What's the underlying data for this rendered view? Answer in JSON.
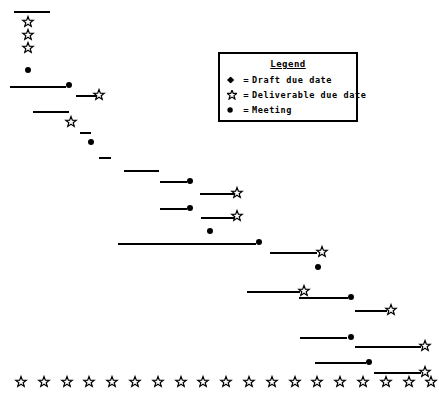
{
  "chart_data": {
    "type": "gantt",
    "title": "",
    "xlabel": "",
    "ylabel": "",
    "grid": false,
    "legend": {
      "title": "Legend",
      "position": "top-right",
      "entries": [
        {
          "symbol": "diamond",
          "equals": "=",
          "label": "Draft due date",
          "color": "#000000"
        },
        {
          "symbol": "star",
          "equals": "=",
          "label": "Deliverable due date",
          "color": "#000000"
        },
        {
          "symbol": "circle",
          "equals": "=",
          "label": "Meeting",
          "color": "#000000"
        }
      ]
    },
    "legend_box": {
      "x": 218,
      "y": 52,
      "width": 140,
      "height": 70
    },
    "bars": [
      {
        "id": "bar-1",
        "x1": 14,
        "x2": 50,
        "y": 11
      },
      {
        "id": "bar-2",
        "x1": 10,
        "x2": 66,
        "y": 86
      },
      {
        "id": "bar-3",
        "x1": 76,
        "x2": 96,
        "y": 95
      },
      {
        "id": "bar-4",
        "x1": 33,
        "x2": 69,
        "y": 111
      },
      {
        "id": "bar-5",
        "x1": 80,
        "x2": 91,
        "y": 132
      },
      {
        "id": "bar-6",
        "x1": 99,
        "x2": 111,
        "y": 157
      },
      {
        "id": "bar-7",
        "x1": 124,
        "x2": 159,
        "y": 170
      },
      {
        "id": "bar-8",
        "x1": 160,
        "x2": 187,
        "y": 181
      },
      {
        "id": "bar-9",
        "x1": 200,
        "x2": 234,
        "y": 193
      },
      {
        "id": "bar-10",
        "x1": 160,
        "x2": 187,
        "y": 208
      },
      {
        "id": "bar-11",
        "x1": 201,
        "x2": 234,
        "y": 217
      },
      {
        "id": "bar-12",
        "x1": 118,
        "x2": 256,
        "y": 243
      },
      {
        "id": "bar-13",
        "x1": 270,
        "x2": 317,
        "y": 252
      },
      {
        "id": "bar-14",
        "x1": 247,
        "x2": 300,
        "y": 291
      },
      {
        "id": "bar-15",
        "x1": 299,
        "x2": 348,
        "y": 297
      },
      {
        "id": "bar-16",
        "x1": 355,
        "x2": 387,
        "y": 310
      },
      {
        "id": "bar-17",
        "x1": 300,
        "x2": 347,
        "y": 337
      },
      {
        "id": "bar-18",
        "x1": 355,
        "x2": 421,
        "y": 346
      },
      {
        "id": "bar-19",
        "x1": 315,
        "x2": 366,
        "y": 362
      },
      {
        "id": "bar-20",
        "x1": 374,
        "x2": 421,
        "y": 372
      }
    ],
    "markers": [
      {
        "id": "m-1",
        "type": "star",
        "x": 28,
        "y": 22
      },
      {
        "id": "m-2",
        "type": "star",
        "x": 28,
        "y": 35
      },
      {
        "id": "m-3",
        "type": "star",
        "x": 28,
        "y": 48
      },
      {
        "id": "m-4",
        "type": "circle",
        "x": 28,
        "y": 70
      },
      {
        "id": "m-5",
        "type": "circle",
        "x": 69,
        "y": 85
      },
      {
        "id": "m-6",
        "type": "star",
        "x": 99,
        "y": 95
      },
      {
        "id": "m-7",
        "type": "star",
        "x": 71,
        "y": 122
      },
      {
        "id": "m-8",
        "type": "circle",
        "x": 91,
        "y": 142
      },
      {
        "id": "m-9",
        "type": "circle",
        "x": 190,
        "y": 181
      },
      {
        "id": "m-10",
        "type": "star",
        "x": 237,
        "y": 193
      },
      {
        "id": "m-11",
        "type": "circle",
        "x": 190,
        "y": 208
      },
      {
        "id": "m-12",
        "type": "star",
        "x": 237,
        "y": 216
      },
      {
        "id": "m-13",
        "type": "circle",
        "x": 210,
        "y": 231
      },
      {
        "id": "m-14",
        "type": "circle",
        "x": 259,
        "y": 242
      },
      {
        "id": "m-15",
        "type": "star",
        "x": 322,
        "y": 252
      },
      {
        "id": "m-16",
        "type": "circle",
        "x": 318,
        "y": 267
      },
      {
        "id": "m-17",
        "type": "star",
        "x": 304,
        "y": 291
      },
      {
        "id": "m-18",
        "type": "circle",
        "x": 351,
        "y": 297
      },
      {
        "id": "m-19",
        "type": "star",
        "x": 391,
        "y": 310
      },
      {
        "id": "m-20",
        "type": "circle",
        "x": 351,
        "y": 337
      },
      {
        "id": "m-21",
        "type": "star",
        "x": 425,
        "y": 346
      },
      {
        "id": "m-22",
        "type": "circle",
        "x": 369,
        "y": 362
      },
      {
        "id": "m-23",
        "type": "star",
        "x": 425,
        "y": 372
      }
    ],
    "axis_row": {
      "y": 382,
      "symbol": "star",
      "x_start": 21,
      "spacing": 22.8,
      "count": 19
    }
  }
}
